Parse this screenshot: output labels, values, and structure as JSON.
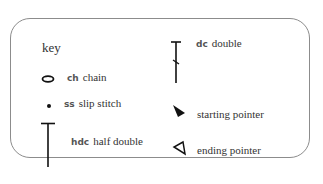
{
  "key": {
    "title": "key",
    "items": [
      {
        "abbr": "ch",
        "label": "chain",
        "icon": "oval-chain-icon"
      },
      {
        "abbr": "ss",
        "label": "slip stitch",
        "icon": "dot-slip-stitch-icon"
      },
      {
        "abbr": "hdc",
        "label": "half double",
        "icon": "t-bar-half-double-icon"
      },
      {
        "abbr": "dc",
        "label": "double",
        "icon": "t-bar-slash-double-icon"
      },
      {
        "abbr": "",
        "label": "starting pointer",
        "icon": "filled-arrow-icon"
      },
      {
        "abbr": "",
        "label": "ending pointer",
        "icon": "outline-arrow-icon"
      }
    ]
  },
  "colors": {
    "border": "#8c8c8c",
    "text": "#333333",
    "symbol": "#111111"
  }
}
